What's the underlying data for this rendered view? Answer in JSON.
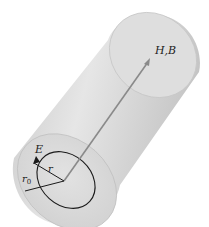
{
  "diagram": {
    "type": "cylinder-field-diagram",
    "labels": {
      "field_hb": "H,B",
      "field_e": "E",
      "radius_r": "r",
      "radius_r0": "r",
      "radius_r0_subscript": "0"
    },
    "colors": {
      "cylinder_body": "#d4d4d4",
      "cylinder_shadow": "#bdbdbd",
      "top_face": "#e2e2e2",
      "bottom_face": "#dadada",
      "line": "#1a1a1a",
      "axis_arrow": "#8a8a8a",
      "background": "#ffffff"
    }
  }
}
